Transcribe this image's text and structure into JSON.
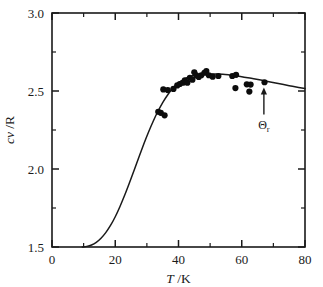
{
  "figure": {
    "width": 323,
    "height": 287,
    "background": "#ffffff",
    "ink_color": "#1a1a1a",
    "point_color": "#0c0c0c"
  },
  "chart_data": {
    "type": "scatter",
    "title": "",
    "subtitle": "",
    "xlabel": "T /K",
    "xlabel_italic_part": "T",
    "xlabel_rest": "/K",
    "ylabel": "cv /R",
    "ylabel_italic_part": "cv",
    "ylabel_rest": "/R",
    "xlim": [
      0,
      80
    ],
    "ylim": [
      1.5,
      3.0
    ],
    "xticks": [
      0,
      20,
      40,
      60,
      80
    ],
    "xtick_labels": [
      "0",
      "20",
      "40",
      "60",
      "80"
    ],
    "xticks_minor": [
      10,
      30,
      50,
      70
    ],
    "yticks": [
      1.5,
      2.0,
      2.5,
      3.0
    ],
    "ytick_labels": [
      "1.5",
      "2.0",
      "2.5",
      "3.0"
    ],
    "yticks_minor": [
      1.75,
      2.25,
      2.75
    ],
    "grid": false,
    "legend": null,
    "frame": "full-box",
    "tick_direction": "in",
    "series": [
      {
        "name": "experimental data",
        "type": "scatter",
        "marker": "filled-circle",
        "marker_radius_px": 3.1,
        "color": "#0c0c0c",
        "points": [
          [
            33.6,
            2.367
          ],
          [
            34.4,
            2.36
          ],
          [
            35.6,
            2.344
          ],
          [
            35.2,
            2.51
          ],
          [
            36.6,
            2.506
          ],
          [
            38.4,
            2.513
          ],
          [
            39.6,
            2.536
          ],
          [
            40.4,
            2.545
          ],
          [
            41.4,
            2.553
          ],
          [
            42.0,
            2.568
          ],
          [
            42.8,
            2.553
          ],
          [
            43.6,
            2.585
          ],
          [
            44.4,
            2.572
          ],
          [
            45.0,
            2.62
          ],
          [
            45.6,
            2.6
          ],
          [
            46.4,
            2.59
          ],
          [
            47.2,
            2.601
          ],
          [
            48.2,
            2.617
          ],
          [
            48.8,
            2.628
          ],
          [
            49.6,
            2.601
          ],
          [
            50.8,
            2.592
          ],
          [
            52.6,
            2.596
          ],
          [
            57.0,
            2.596
          ],
          [
            58.2,
            2.604
          ],
          [
            58.0,
            2.519
          ],
          [
            61.6,
            2.543
          ],
          [
            62.4,
            2.496
          ],
          [
            62.8,
            2.541
          ],
          [
            67.2,
            2.556
          ]
        ]
      },
      {
        "name": "theoretical curve",
        "type": "line",
        "color": "#1a1a1a",
        "points": [
          [
            9.6,
            1.5
          ],
          [
            11.0,
            1.504
          ],
          [
            12.5,
            1.513
          ],
          [
            14.0,
            1.53
          ],
          [
            15.5,
            1.556
          ],
          [
            17.0,
            1.592
          ],
          [
            18.5,
            1.638
          ],
          [
            20.0,
            1.694
          ],
          [
            21.5,
            1.76
          ],
          [
            23.0,
            1.833
          ],
          [
            24.5,
            1.912
          ],
          [
            26.0,
            1.994
          ],
          [
            27.5,
            2.077
          ],
          [
            29.0,
            2.158
          ],
          [
            30.5,
            2.235
          ],
          [
            32.0,
            2.306
          ],
          [
            33.5,
            2.37
          ],
          [
            35.0,
            2.426
          ],
          [
            36.5,
            2.473
          ],
          [
            38.0,
            2.512
          ],
          [
            39.5,
            2.543
          ],
          [
            41.0,
            2.566
          ],
          [
            42.5,
            2.583
          ],
          [
            44.0,
            2.595
          ],
          [
            45.5,
            2.602
          ],
          [
            47.0,
            2.606
          ],
          [
            48.5,
            2.608
          ],
          [
            50.0,
            2.609
          ],
          [
            52.0,
            2.609
          ],
          [
            54.0,
            2.607
          ],
          [
            56.0,
            2.603
          ],
          [
            58.0,
            2.598
          ],
          [
            60.0,
            2.592
          ],
          [
            63.0,
            2.581
          ],
          [
            66.0,
            2.57
          ],
          [
            69.0,
            2.558
          ],
          [
            72.0,
            2.546
          ],
          [
            75.0,
            2.534
          ],
          [
            78.0,
            2.523
          ],
          [
            80.0,
            2.516
          ]
        ]
      }
    ],
    "annotations": [
      {
        "name": "theta-r-marker",
        "label": "Θ",
        "subscript": "r",
        "x": 67.0,
        "y": 2.44,
        "arrow_from_y": 2.4,
        "arrow_to_y": 2.5,
        "arrow_direction": "up"
      }
    ]
  }
}
